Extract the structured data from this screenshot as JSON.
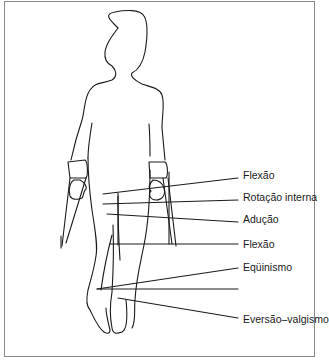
{
  "figure": {
    "labels": [
      {
        "id": "flexao-1",
        "text": "Flexão",
        "x": 243,
        "y": 175
      },
      {
        "id": "rotacao-interna",
        "text": "Rotação interna",
        "x": 243,
        "y": 197
      },
      {
        "id": "aducao",
        "text": "Adução",
        "x": 243,
        "y": 219
      },
      {
        "id": "flexao-2",
        "text": "Flexão",
        "x": 243,
        "y": 241
      },
      {
        "id": "equinismo",
        "text": "Eqüinismo",
        "x": 243,
        "y": 286
      },
      {
        "id": "eversao-valgismo",
        "text": "Eversão–valgismo",
        "x": 243,
        "y": 316
      }
    ]
  }
}
